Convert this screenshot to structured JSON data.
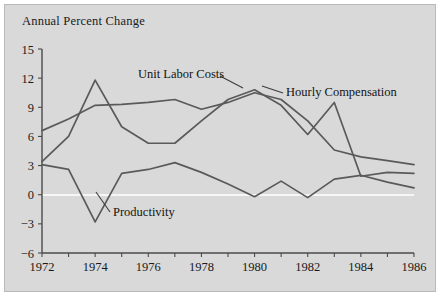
{
  "chart_data": {
    "type": "line",
    "title": "Annual Percent Change",
    "xlabel": "",
    "ylabel": "",
    "xlim": [
      1972,
      1986
    ],
    "ylim": [
      -6,
      15
    ],
    "yticks": [
      15,
      12,
      9,
      6,
      3,
      0,
      -3,
      -6
    ],
    "xticks": [
      1972,
      1974,
      1976,
      1978,
      1980,
      1982,
      1984,
      1986
    ],
    "x": [
      1972,
      1973,
      1974,
      1975,
      1976,
      1977,
      1978,
      1979,
      1980,
      1981,
      1982,
      1983,
      1984,
      1985,
      1986
    ],
    "grid": false,
    "legend": "inline-annotations",
    "zero_line": true,
    "zero_line_color": "#ffffff",
    "line_color": "#5a5a5a",
    "plot_background": "#d9d9d9",
    "page_background": "#ffffff",
    "series": [
      {
        "name": "Hourly Compensation",
        "values": [
          6.6,
          7.8,
          9.2,
          9.3,
          9.5,
          9.8,
          8.8,
          9.5,
          10.5,
          9.8,
          7.6,
          4.6,
          3.9,
          3.5,
          3.1
        ]
      },
      {
        "name": "Unit Labor Costs",
        "values": [
          3.4,
          6.0,
          11.8,
          7.0,
          5.3,
          5.3,
          7.6,
          9.8,
          10.8,
          9.2,
          6.2,
          9.5,
          1.9,
          2.3,
          2.2
        ]
      },
      {
        "name": "Productivity",
        "values": [
          3.1,
          2.6,
          -2.8,
          2.2,
          2.6,
          3.3,
          2.3,
          1.1,
          -0.2,
          1.4,
          -0.3,
          1.6,
          2.0,
          1.3,
          0.7
        ]
      }
    ],
    "annotations": [
      {
        "text": "Unit Labor Costs",
        "x_px": 138,
        "y_px": 78
      },
      {
        "text": "Hourly Compensation",
        "x_px": 286,
        "y_px": 96
      },
      {
        "text": "Productivity",
        "x_px": 113,
        "y_px": 216
      }
    ]
  },
  "axis": {
    "y_tick_labels": [
      "15",
      "12",
      "9",
      "6",
      "3",
      "0",
      "−3",
      "−6"
    ],
    "x_tick_labels": [
      "1972",
      "1974",
      "1976",
      "1978",
      "1980",
      "1982",
      "1984",
      "1986"
    ]
  }
}
